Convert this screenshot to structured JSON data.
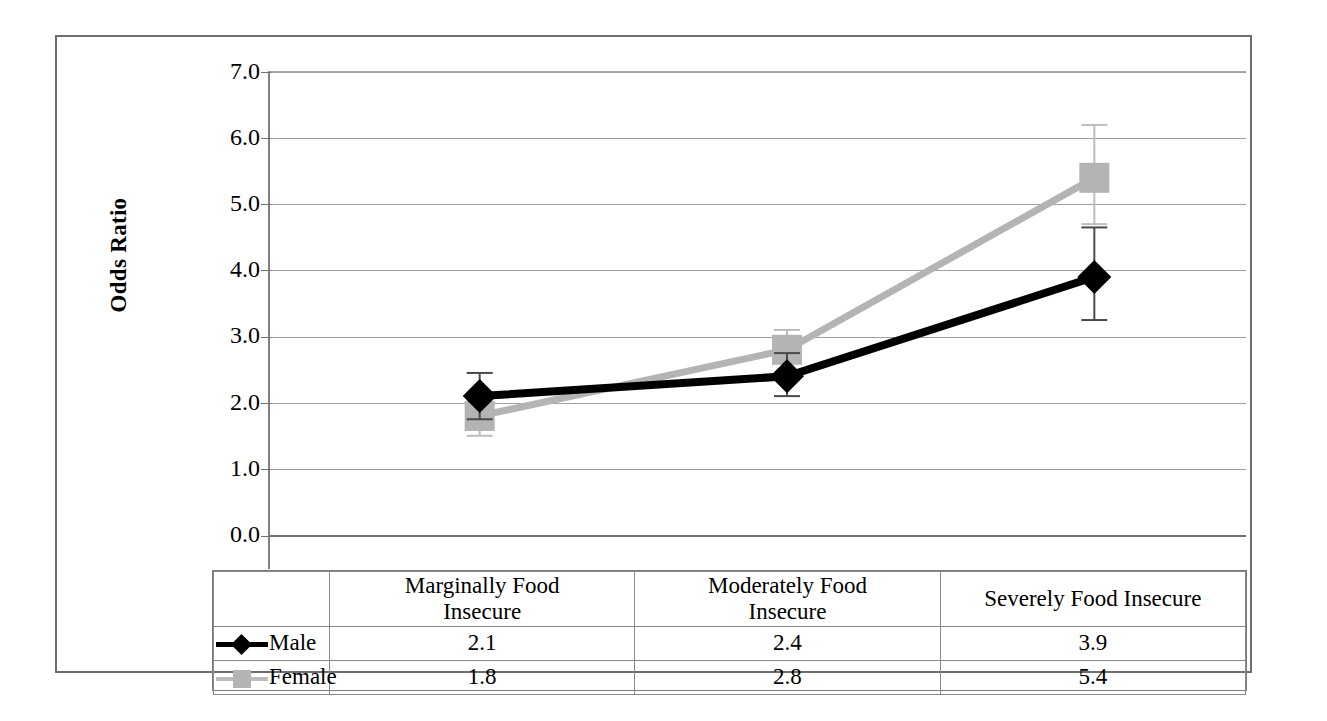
{
  "chart_data": {
    "type": "line",
    "title": "",
    "xlabel": "",
    "ylabel": "Odds Ratio",
    "ylim": [
      0.0,
      7.0
    ],
    "ytick_labels": [
      "7.0",
      "6.0",
      "5.0",
      "4.0",
      "3.0",
      "2.0",
      "1.0",
      "0.0"
    ],
    "ytick_values": [
      7.0,
      6.0,
      5.0,
      4.0,
      3.0,
      2.0,
      1.0,
      0.0
    ],
    "grid": true,
    "legend_position": "data-table-left",
    "categories": [
      "Marginally Food Insecure",
      "Moderately Food Insecure",
      "Severely Food Insecure"
    ],
    "series": [
      {
        "name": "Male",
        "color": "#000000",
        "marker": "diamond",
        "values": [
          2.1,
          2.4,
          3.9
        ],
        "error_low": [
          1.75,
          2.1,
          3.25
        ],
        "error_high": [
          2.45,
          2.75,
          4.65
        ]
      },
      {
        "name": "Female",
        "color": "#b4b4b4",
        "marker": "square",
        "values": [
          1.8,
          2.8,
          5.4
        ],
        "error_low": [
          1.5,
          2.45,
          4.7
        ],
        "error_high": [
          2.05,
          3.1,
          6.2
        ]
      }
    ]
  },
  "table": {
    "category_headers": [
      "Marginally Food\nInsecure",
      "Moderately Food\nInsecure",
      "Severely Food Insecure"
    ],
    "rows": [
      {
        "legend_label": "Male",
        "values": [
          "2.1",
          "2.4",
          "3.9"
        ]
      },
      {
        "legend_label": "Female",
        "values": [
          "1.8",
          "2.8",
          "5.4"
        ]
      }
    ]
  }
}
